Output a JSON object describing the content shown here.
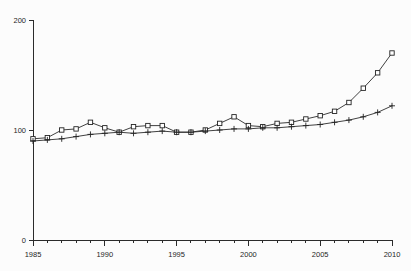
{
  "chart_data": {
    "type": "line",
    "title": "",
    "subtitle": "",
    "xlabel": "",
    "ylabel": "",
    "xlim": [
      1985,
      2010
    ],
    "ylim": [
      0,
      200
    ],
    "yticks": [
      0,
      100,
      200
    ],
    "ytick_labels": [
      "0",
      "100",
      "200"
    ],
    "xticks": [
      1985,
      1990,
      1995,
      2000,
      2005,
      2010
    ],
    "xtick_labels": [
      "1985",
      "1990",
      "1995",
      "2000",
      "2005",
      "2010"
    ],
    "xminor_step": 1,
    "grid": false,
    "legend": null,
    "legend_position": "none",
    "annotations": [],
    "x": [
      1985,
      1986,
      1987,
      1988,
      1989,
      1990,
      1991,
      1992,
      1993,
      1994,
      1995,
      1996,
      1997,
      1998,
      1999,
      2000,
      2001,
      2002,
      2003,
      2004,
      2005,
      2006,
      2007,
      2008,
      2009,
      2010
    ],
    "series": [
      {
        "name": "series-squares",
        "marker": "square",
        "values": [
          92,
          93,
          100,
          101,
          107,
          102,
          98,
          103,
          104,
          104,
          98,
          98,
          100,
          106,
          112,
          104,
          103,
          106,
          107,
          110,
          113,
          117,
          125,
          138,
          152,
          170
        ]
      },
      {
        "name": "series-plus",
        "marker": "plus",
        "values": [
          90,
          91,
          92,
          94,
          96,
          97,
          98,
          97,
          98,
          99,
          98,
          98,
          99,
          100,
          101,
          101,
          102,
          102,
          103,
          104,
          105,
          107,
          109,
          112,
          116,
          122
        ]
      }
    ]
  }
}
